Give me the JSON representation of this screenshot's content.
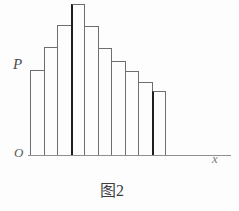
{
  "chart_data": {
    "type": "bar",
    "title": "图2",
    "xlabel": "x",
    "ylabel": "P",
    "origin_label": "O",
    "x_indices": [
      1,
      2,
      3,
      4,
      5,
      6,
      7,
      8,
      9,
      10
    ],
    "relative_heights": [
      0.563,
      0.715,
      0.861,
      1.0,
      0.854,
      0.709,
      0.623,
      0.556,
      0.483,
      0.424
    ],
    "bar_count": 10,
    "grid": false,
    "legend": null,
    "axis_numeric_ticks": "none visible",
    "style": {
      "line_color": "#6e6e6e",
      "bold_line_color": "#1f1f1f",
      "bold_left_edge_indices": [
        3,
        9
      ],
      "background": "#fdfdfd",
      "bars_filled": false
    }
  }
}
